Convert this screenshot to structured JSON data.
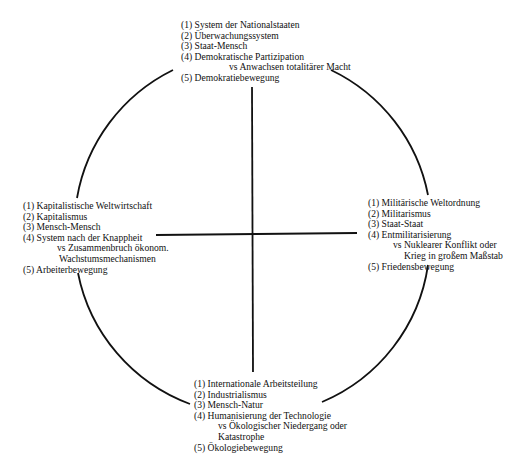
{
  "diagram": {
    "line_color": "#111111",
    "text_color": "#111111",
    "quadrants": {
      "top": {
        "items": [
          {
            "label": "(1) System der Nationalstaaten"
          },
          {
            "label": "(2) Überwachungssystem"
          },
          {
            "label": "(3) Staat-Mensch"
          },
          {
            "label": "(4) Demokratische Partizipation",
            "continuation": [
              "vs Anwachsen totalitärer Macht"
            ]
          },
          {
            "label": "(5) Demokratiebewegung"
          }
        ]
      },
      "left": {
        "items": [
          {
            "label": "(1) Kapitalistische Weltwirtschaft"
          },
          {
            "label": "(2) Kapitalismus"
          },
          {
            "label": "(3) Mensch-Mensch"
          },
          {
            "label": "(4) System nach der Knappheit",
            "continuation": [
              "vs Zusammenbruch ökonom.",
              "Wachstumsmechanismen"
            ]
          },
          {
            "label": "(5) Arbeiterbewegung"
          }
        ]
      },
      "right": {
        "items": [
          {
            "label": "(1) Militärische Weltordnung"
          },
          {
            "label": "(2) Militarismus"
          },
          {
            "label": "(3) Staat-Staat"
          },
          {
            "label": "(4) Entmilitarisierung",
            "continuation": [
              "vs Nuklearer Konflikt oder",
              "Krieg in großem Maßstab"
            ]
          },
          {
            "label": "(5) Friedensbewegung"
          }
        ]
      },
      "bottom": {
        "items": [
          {
            "label": "(1) Internationale Arbeitsteilung"
          },
          {
            "label": "(2) Industrialismus"
          },
          {
            "label": "(3) Mensch-Natur"
          },
          {
            "label": "(4) Humanisierung der Technologie",
            "continuation": [
              "vs Ökologischer Niedergang oder",
              "Katastrophe"
            ]
          },
          {
            "label": "(5) Ökologiebewegung"
          }
        ]
      }
    }
  }
}
